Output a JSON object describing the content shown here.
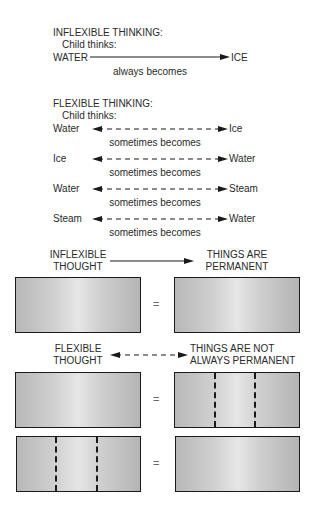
{
  "inflexible_thinking": {
    "heading": "INFLEXIBLE THINKING:",
    "sub": "Child thinks:",
    "from": "WATER",
    "to": "ICE",
    "relation": "always becomes"
  },
  "flexible_thinking": {
    "heading": "FLEXIBLE THINKING:",
    "sub": "Child thinks:",
    "rows": [
      {
        "from": "Water",
        "to": "Ice",
        "relation": "sometimes becomes"
      },
      {
        "from": "Ice",
        "to": "Water",
        "relation": "sometimes becomes"
      },
      {
        "from": "Water",
        "to": "Steam",
        "relation": "sometimes becomes"
      },
      {
        "from": "Steam",
        "to": "Water",
        "relation": "sometimes becomes"
      }
    ]
  },
  "inflexible_thought": {
    "left_line1": "INFLEXIBLE",
    "left_line2": "THOUGHT",
    "right_line1": "THINGS ARE",
    "right_line2": "PERMANENT",
    "equals": "="
  },
  "flexible_thought": {
    "left_line1": "FLEXIBLE",
    "left_line2": "THOUGHT",
    "right_line1": "THINGS ARE NOT",
    "right_line2": "ALWAYS PERMANENT",
    "equals_1": "=",
    "equals_2": "="
  },
  "colors": {
    "text": "#2a2a2a",
    "box_border": "#1a1a1a",
    "box_fill_edge": "#b8b8b8",
    "box_fill_center": "#e6e6e6"
  }
}
